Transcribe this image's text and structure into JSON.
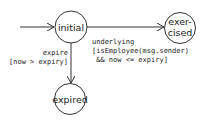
{
  "diagram": {
    "type": "state-machine",
    "colors": {
      "stroke": "#333333",
      "text": "#222222",
      "background": "#ffffff"
    },
    "states": [
      {
        "id": "initial",
        "lines": [
          "initial"
        ]
      },
      {
        "id": "exercised",
        "lines": [
          "exer-",
          "cised"
        ]
      },
      {
        "id": "expired",
        "lines": [
          "expired"
        ]
      }
    ],
    "transitions": [
      {
        "from": "start",
        "to": "initial",
        "label_lines": []
      },
      {
        "from": "initial",
        "to": "exercised",
        "label_lines": [
          "underlying",
          "[isEmployee(msg.sender)",
          " && now <= expiry]"
        ]
      },
      {
        "from": "initial",
        "to": "expired",
        "label_lines": [
          "expire",
          "[now > expiry]"
        ]
      }
    ]
  }
}
